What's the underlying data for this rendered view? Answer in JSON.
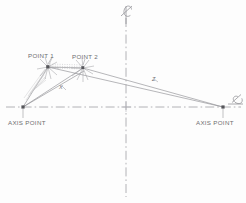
{
  "diagram": {
    "background_color": "#fdfdfd",
    "line_color": "#8a8a8e",
    "text_color": "#6d6d70",
    "labels": {
      "point_1": "POINT 1",
      "point_2": "POINT 2",
      "axis_point_left": "AXIS POINT",
      "axis_point_right": "AXIS POINT",
      "dimension_x": "X",
      "dimension_z": "Z",
      "centerline_top": "℄",
      "centerline_right": "℄"
    },
    "nodes": [
      {
        "name": "axis-point-left",
        "x": 23,
        "y": 107
      },
      {
        "name": "point-1",
        "x": 48,
        "y": 67
      },
      {
        "name": "point-2",
        "x": 83,
        "y": 68
      },
      {
        "name": "axis-point-right",
        "x": 223,
        "y": 107
      }
    ],
    "construction_lines": {
      "vertical_centerline": {
        "x": 126,
        "y1": 18,
        "y2": 197
      },
      "horizontal_centerline": {
        "y": 107,
        "x1": 6,
        "x2": 241
      }
    },
    "edges": [
      {
        "name": "left-axis-to-point-1",
        "from": "axis-point-left",
        "to": "point-1"
      },
      {
        "name": "left-axis-to-point-2",
        "from": "axis-point-left",
        "to": "point-2"
      },
      {
        "name": "point-1-to-right-axis",
        "from": "point-1",
        "to": "axis-point-right"
      },
      {
        "name": "point-2-to-right-axis",
        "from": "point-2",
        "to": "axis-point-right"
      },
      {
        "name": "point-1-to-point-2",
        "from": "point-1",
        "to": "point-2"
      }
    ],
    "dimension_callouts": [
      {
        "name": "x-dimension",
        "label": "X",
        "between": [
          "axis-point-left",
          "point-2"
        ]
      },
      {
        "name": "z-dimension",
        "label": "Z",
        "between": [
          "point-2",
          "axis-point-right"
        ]
      }
    ]
  }
}
